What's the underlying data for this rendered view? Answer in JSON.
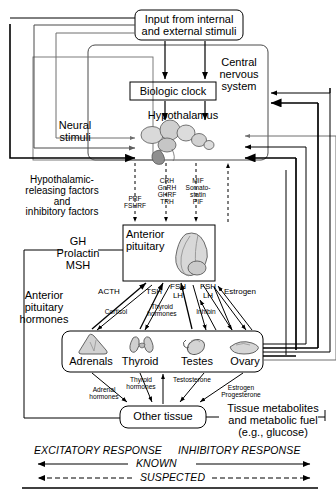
{
  "diagram": {
    "boxes": {
      "input": "Input from internal\nand external stimuli",
      "cns": "Central\nnervous\nsystem",
      "biologic_clock": "Biologic clock",
      "hypothalamus": "Hypothalamus",
      "anterior_pituitary": "Anterior\npituitary",
      "other_tissue": "Other tissue"
    },
    "side_labels": {
      "neural_stimuli": "Neural\nstimuli",
      "hypothalamic_factors": "Hypothalamic-\nreleasing factors\nand\ninhibitory factors",
      "gh_group": "GH\nProlactin\nMSH",
      "anterior_pituitary_hormones": "Anterior\npituitary\nhormones",
      "tissue_metabolites": "Tissue metabolites\nand metabolic fuel\n(e.g., glucose)"
    },
    "releasing_factors": [
      {
        "name": "prf-fshrf",
        "text": "PRF\nFSHRF"
      },
      {
        "name": "crh-group",
        "text": "CRH\nGnRH\nGHRF\nTRH"
      },
      {
        "name": "mif-group",
        "text": "MIF\nSomato-\nstatin\nPIF"
      }
    ],
    "tropic_hormones": [
      {
        "name": "acth",
        "text": "ACTH"
      },
      {
        "name": "tsh",
        "text": "TSH"
      },
      {
        "name": "fsh-lh-testes",
        "text": "FSH\nLH"
      },
      {
        "name": "fsh-lh-ovary",
        "text": "FSH\nLH"
      },
      {
        "name": "estrogen-feedback",
        "text": "Estrogen"
      }
    ],
    "feedback_hormones": [
      {
        "name": "cortisol",
        "text": "Cortisol"
      },
      {
        "name": "thyroid-hormones-upper",
        "text": "Thyroid\nhormones"
      },
      {
        "name": "inhibin",
        "text": "Inhibin"
      }
    ],
    "glands": [
      {
        "name": "adrenals",
        "label": "Adrenals"
      },
      {
        "name": "thyroid",
        "label": "Thyroid"
      },
      {
        "name": "testes",
        "label": "Testes"
      },
      {
        "name": "ovary",
        "label": "Ovary"
      }
    ],
    "gland_products": [
      {
        "name": "adrenal-hormones",
        "text": "Adrenal\nhormones"
      },
      {
        "name": "thyroid-hormones-lower",
        "text": "Thyroid\nhormones"
      },
      {
        "name": "testosterone",
        "text": "Testosterone"
      },
      {
        "name": "estrogen-progesterone",
        "text": "Estrogen\nProgesterone"
      }
    ],
    "legend": {
      "excitatory": "EXCITATORY RESPONSE",
      "inhibitory": "INHIBITORY RESPONSE",
      "known": "KNOWN",
      "suspected": "SUSPECTED"
    },
    "colors": {
      "line": "#000000",
      "gray_line": "#6e6e6e",
      "background": "#ffffff",
      "gland_fill": "#d5d5d5",
      "gland_shade": "#9a9a9a"
    }
  }
}
